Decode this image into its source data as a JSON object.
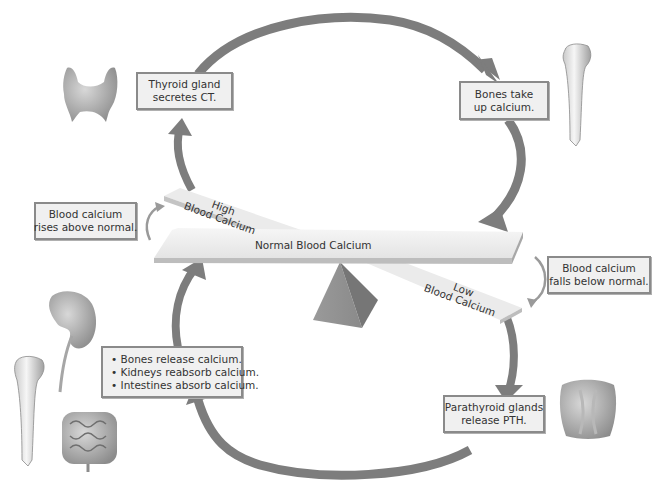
{
  "diagram": {
    "colors": {
      "arrow": "#7d7d7d",
      "box_fill": "#f0f0f0",
      "box_border": "#8a8a8a",
      "beam": "#ececec",
      "fulcrum": "#8f8f8f",
      "text": "#333333"
    },
    "seesaw": {
      "normal_label": "Normal Blood Calcium",
      "high_label_line1": "High",
      "high_label_line2": "Blood Calcium",
      "low_label_line1": "Low",
      "low_label_line2": "Blood Calcium"
    },
    "boxes": {
      "rises": {
        "line1": "Blood calcium",
        "line2": "rises above normal."
      },
      "thyroid": {
        "line1": "Thyroid gland",
        "line2": "secretes CT."
      },
      "bones_take": {
        "line1": "Bones take",
        "line2": "up calcium."
      },
      "falls": {
        "line1": "Blood calcium",
        "line2": "falls below normal."
      },
      "parathyroid": {
        "line1": "Parathyroid glands",
        "line2": "release PTH."
      },
      "effects": {
        "items": [
          "Bones release calcium.",
          "Kidneys reabsorb calcium.",
          "Intestines absorb calcium."
        ]
      }
    },
    "illustrations": {
      "thyroid": "thyroid-gland-icon",
      "bone_top": "bone-icon",
      "kidney": "kidney-icon",
      "bone_bottom": "bone-icon",
      "intestines": "intestines-icon",
      "parathyroid": "parathyroid-glands-icon"
    }
  }
}
